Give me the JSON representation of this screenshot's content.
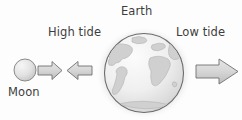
{
  "diagram": {
    "background_color": "#fdfdfd",
    "text_color": "#3d3d3d",
    "labels": {
      "earth": "Earth",
      "high_tide": "High tide",
      "low_tide": "Low tide",
      "moon": "Moon"
    },
    "bodies": [
      {
        "name": "moon",
        "label": "Moon",
        "shape": "circle",
        "cx": 25,
        "cy": 70,
        "r": 11,
        "fill_light": "#f2f2f2",
        "fill_dark": "#c9c9c9",
        "stroke": "#8a8a8a"
      },
      {
        "name": "earth",
        "label": "Earth",
        "shape": "circle",
        "cx": 144,
        "cy": 73,
        "r": 40,
        "fill_light": "#fbfbfb",
        "fill_dark": "#d6d6d6",
        "stroke": "#6e6e6e",
        "halo": "#f0f0f0",
        "continents_fill": "#cfcfcf",
        "continents_stroke": "#b0b0b0"
      }
    ],
    "arrows": [
      {
        "name": "arrow-moon-pull",
        "direction": "right",
        "x": 38,
        "y": 61,
        "width": 24,
        "height": 19,
        "fill": "#d7d7d7",
        "stroke": "#707070",
        "meaning": "gravitational pull toward Moon"
      },
      {
        "name": "arrow-high-tide",
        "direction": "left",
        "x": 66,
        "y": 61,
        "width": 26,
        "height": 19,
        "fill": "#d7d7d7",
        "stroke": "#707070",
        "meaning": "high tide bulge toward Moon"
      },
      {
        "name": "arrow-low-tide",
        "direction": "right",
        "x": 196,
        "y": 59,
        "width": 42,
        "height": 25,
        "fill": "#d7d7d7",
        "stroke": "#707070",
        "meaning": "tidal bulge away from Moon"
      }
    ]
  }
}
